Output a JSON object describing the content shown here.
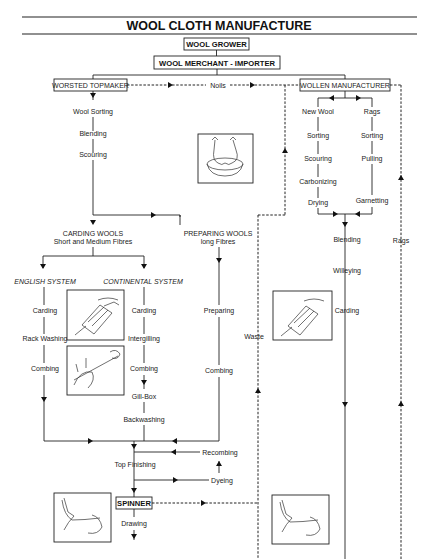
{
  "title": "WOOL CLOTH MANUFACTURE",
  "nodes": {
    "grower": "WOOL GROWER",
    "merchant": "WOOL MERCHANT - IMPORTER",
    "topmaker": "WORSTED TOPMAKER",
    "noils": "Noils",
    "wollen": "WOLLEN MANUFACTURER",
    "spinner": "SPINNER"
  },
  "worsted_steps": [
    "Wool Sorting",
    "Blending",
    "Scouring"
  ],
  "carding_wools": {
    "line1": "CARDING WOOLS",
    "line2": "Short and Medium Fibres"
  },
  "preparing_wools": {
    "line1": "PREPARING WOOLS",
    "line2": "long Fibres"
  },
  "english_system": {
    "label": "ENGLISH SYSTEM",
    "steps": [
      "Carding",
      "Rack Washing",
      "Combing"
    ]
  },
  "continental_system": {
    "label": "CONTINENTAL SYSTEM",
    "steps": [
      "Carding",
      "Intergilling",
      "Combing",
      "Gill-Box",
      "Backwashing"
    ]
  },
  "preparing_steps": [
    "Preparing",
    "Combing"
  ],
  "finishing": {
    "top_finishing": "Top Finishing",
    "recombing": "Recombing",
    "dyeing": "Dyeing",
    "drawing": "Drawing"
  },
  "wollen_new_wool": [
    "New Wool",
    "Sorting",
    "Scouring",
    "Carbonizing",
    "Drying"
  ],
  "wollen_rags": [
    "Rags",
    "Sorting",
    "Pulling",
    "Garnetting"
  ],
  "wollen_steps": [
    "Blending",
    "Willeying",
    "Carding"
  ],
  "side_labels": {
    "waste": "Waste",
    "rags": "Rags"
  },
  "illustrations": [
    "scouring-hands-in-basin",
    "hand-carding",
    "hand-combing",
    "wollen-hand-carding",
    "hand-spinning-left",
    "hand-spinning-right"
  ]
}
